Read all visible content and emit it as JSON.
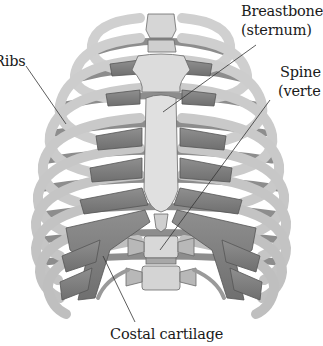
{
  "diagram": {
    "colors": {
      "bone": "#d9d9d9",
      "bone_shade": "#a8a8a8",
      "cartilage": "#8a8a8a",
      "cartilage_dark": "#6a6a6a",
      "outline": "#5a5a5a",
      "leader_line": "#333333",
      "background": "#ffffff"
    },
    "labels": [
      {
        "id": "ribs",
        "text": "Ribs"
      },
      {
        "id": "breastbone_line1",
        "text": "Breastbone"
      },
      {
        "id": "breastbone_line2",
        "text": "(sternum)"
      },
      {
        "id": "spine_line1",
        "text": "Spine"
      },
      {
        "id": "spine_line2",
        "text": "(verte"
      },
      {
        "id": "costal",
        "text": "Costal cartilage"
      }
    ]
  }
}
